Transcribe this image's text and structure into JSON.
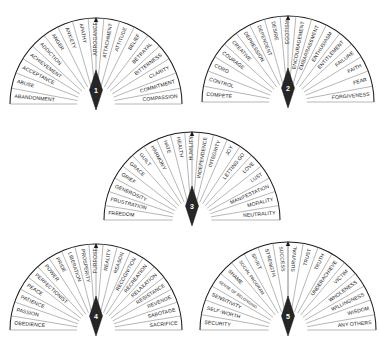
{
  "document": {
    "title": "Emotion Dial Charts",
    "type": "five semicircular dial charts with alphabetical word segments"
  },
  "dials": [
    {
      "number": "1",
      "pointer_label": "1",
      "left_labels": [
        "ABANDONMENT",
        "ABUSE",
        "ACCEPTANCE",
        "ACHIEVEMENT",
        "ADDICTION",
        "ANGER",
        "ANXIETY",
        "APATHY",
        "ARROGANCE"
      ],
      "right_labels": [
        "ATTACHMENT",
        "ATTITUDE",
        "BELIEF",
        "BETRAYAL",
        "BITTERNESS",
        "CLARITY",
        "COMMITMENT",
        "COMPASSION"
      ]
    },
    {
      "number": "2",
      "pointer_label": "2",
      "left_labels": [
        "COMPETE",
        "CONTROL",
        "CORD",
        "COURAGE",
        "CREATIVE",
        "DEPRESSION",
        "DEPENDENT",
        "DESIRE"
      ],
      "right_labels": [
        "EGOTISM",
        "ENCOURAGEMENT",
        "EMBARRASSMENT",
        "ENTHUSIASM",
        "ENTITLEMENT",
        "FAILURE",
        "FAITH",
        "FEAR",
        "FORGIVENESS"
      ]
    },
    {
      "number": "3",
      "pointer_label": "3",
      "left_labels": [
        "FREEDOM",
        "FRUSTRATION",
        "GENEROSITY",
        "GRIEF",
        "GRACE",
        "GUILT",
        "HARMONY",
        "HATE",
        "HEALTH"
      ],
      "right_labels": [
        "HUMILITY",
        "INDEPENDENCE",
        "INTEGRITY",
        "JOY",
        "LETTING GO",
        "LOVE",
        "LUST",
        "MANIFESTATION",
        "MORALITY",
        "NEUTRALITY"
      ]
    },
    {
      "number": "4",
      "pointer_label": "4",
      "left_labels": [
        "OBEDIENCE",
        "PASSION",
        "PATIENCE",
        "PEACE",
        "PERFECTIONIST",
        "POWER",
        "PRIDE",
        "LIBERATION",
        "PROSPERITY",
        "PURPOSE"
      ],
      "right_labels": [
        "REALITY",
        "REASON",
        "RECOGNITION",
        "RECREATION",
        "RELAXATION",
        "RESISTANCE",
        "REVENGE",
        "SABOTAGE",
        "SACRIFICE"
      ]
    },
    {
      "number": "5",
      "pointer_label": "5",
      "left_labels": [
        "SECURITY",
        "SELF-WORTH",
        "SENSITIVITY",
        "SENSE OF BELONGING",
        "SHAME",
        "SOCIAL PROGRAM",
        "SPIRIT",
        "STRENGTH"
      ],
      "right_labels": [
        "SUCCESS",
        "SURVIVAL",
        "TRUST",
        "TRUTH",
        "UNDERACHIEVE",
        "VICTIM",
        "WHOLENESS",
        "WILLINGNESS",
        "WISDOM",
        "ANY OTHERS"
      ]
    }
  ],
  "colors": {
    "ink": "#171717",
    "outline": "#1b1b1b",
    "spoke": "#6f6f6f",
    "needle": "#262626",
    "background": "#ffffff"
  },
  "layout": {
    "positions": [
      {
        "cx": 96,
        "cy": 104,
        "r": 86
      },
      {
        "cx": 288,
        "cy": 102,
        "r": 86
      },
      {
        "cx": 192,
        "cy": 220,
        "r": 88
      },
      {
        "cx": 96,
        "cy": 330,
        "r": 86
      },
      {
        "cx": 288,
        "cy": 330,
        "r": 88
      }
    ]
  }
}
